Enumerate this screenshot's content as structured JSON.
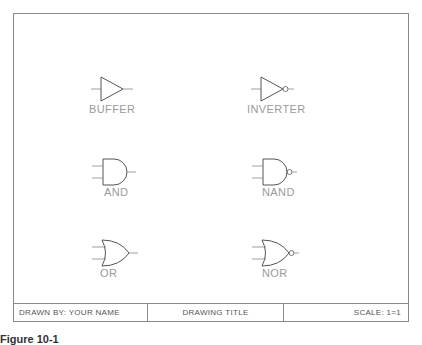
{
  "drawing": {
    "gates": [
      {
        "id": "buffer",
        "label": "BUFFER"
      },
      {
        "id": "inverter",
        "label": "INVERTER"
      },
      {
        "id": "and",
        "label": "AND"
      },
      {
        "id": "nand",
        "label": "NAND"
      },
      {
        "id": "or",
        "label": "OR"
      },
      {
        "id": "nor",
        "label": "NOR"
      }
    ],
    "line_color": "#555555",
    "label_color": "#9a9a9a"
  },
  "title_block": {
    "drawn_by": "DRAWN BY: YOUR NAME",
    "drawing_title": "DRAWING TITLE",
    "scale": "SCALE: 1=1"
  },
  "caption": "Figure 10-1"
}
